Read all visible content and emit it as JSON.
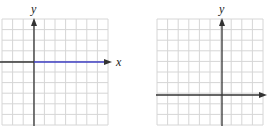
{
  "graphs": [
    {
      "id": "left",
      "grid": {
        "x0": 2,
        "y0": 19,
        "cols": 10,
        "rows": 10,
        "cell": 10.6
      },
      "y_axis_x": 34,
      "x_axis_y": 62,
      "y_label": "y",
      "x_label": "x",
      "highlight": {
        "description": "horizontal line along positive x-axis",
        "color": "#3c3cc0"
      }
    },
    {
      "id": "right",
      "grid": {
        "x0": 157,
        "y0": 19,
        "cols": 10,
        "rows": 10,
        "cell": 10.6
      },
      "y_axis_x": 222,
      "x_axis_y": 95,
      "y_label": "y",
      "x_label": "x"
    }
  ],
  "colors": {
    "grid": "#d6d6d6",
    "axis": "#333333",
    "highlight": "#3c3cc0"
  }
}
